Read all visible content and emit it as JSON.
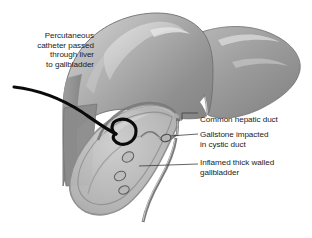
{
  "figure": {
    "background_color": "#ffffff",
    "label_text_color": "#1b1b1b",
    "leader_line_color": "#3c3c3c",
    "catheter_color": "#0a0a0a",
    "liver_fill_dark": "#7e7e7e",
    "liver_fill_mid": "#9a9a9a",
    "liver_fill_light": "#c2c2c2",
    "liver_highlight": "#d8d8d8",
    "liver_outline": "#6f6f6f",
    "gallbladder_fill": "#b9b9b9",
    "gallbladder_wall": "#8d8d8d",
    "duct_fill": "#a8a8a8",
    "duct_outline": "#7a7a7a",
    "stone_outline": "#5d5d5d"
  },
  "labels": {
    "catheter": {
      "lines": [
        "Percutaneous",
        "catheter passed",
        "through liver",
        "to gallbladder"
      ],
      "text": "Percutaneous\ncatheter passed\nthrough liver\nto gallbladder",
      "align": "right"
    },
    "common_hepatic_duct": {
      "lines": [
        "Common hepatic duct"
      ],
      "text": "Common hepatic duct",
      "align": "left"
    },
    "gallstone": {
      "lines": [
        "Gallstone impacted",
        "in cystic duct"
      ],
      "text": "Gallstone impacted\nin cystic duct",
      "align": "left"
    },
    "inflamed_gallbladder": {
      "lines": [
        "Inflamed thick walled",
        "gallbladder"
      ],
      "text": "Inflamed thick walled\ngallbladder",
      "align": "left"
    }
  },
  "anatomy": {
    "organs": [
      "liver",
      "gallbladder",
      "common hepatic duct",
      "cystic duct",
      "common bile duct"
    ],
    "devices": [
      "percutaneous drainage catheter with pigtail coil"
    ],
    "findings": [
      "gallstone impacted in cystic duct",
      "gallstones within gallbladder",
      "thickened inflamed gallbladder wall"
    ],
    "gallstone_count_in_gallbladder": 3
  }
}
